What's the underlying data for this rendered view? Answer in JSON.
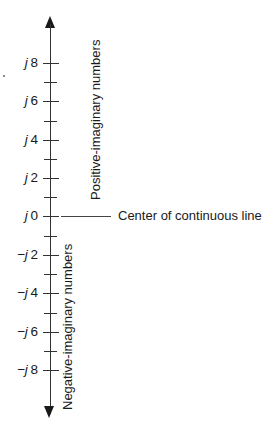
{
  "diagram": {
    "axis": {
      "orientation": "vertical",
      "arrows": [
        "up",
        "down"
      ],
      "center_y": 216,
      "major_spacing_px": 38.4
    },
    "ticks": [
      {
        "prefix": "j",
        "value": "8",
        "y": 63
      },
      {
        "prefix": "j",
        "value": "6",
        "y": 101
      },
      {
        "prefix": "j",
        "value": "4",
        "y": 140
      },
      {
        "prefix": "j",
        "value": "2",
        "y": 178
      },
      {
        "prefix": "j",
        "value": "0",
        "y": 216
      },
      {
        "prefix": "−j",
        "value": "2",
        "y": 255
      },
      {
        "prefix": "−j",
        "value": "4",
        "y": 293
      },
      {
        "prefix": "−j",
        "value": "6",
        "y": 332
      },
      {
        "prefix": "−j",
        "value": "8",
        "y": 370
      }
    ],
    "minor_ticks_y": [
      82,
      121,
      159,
      197,
      236,
      274,
      313,
      351
    ],
    "labels": {
      "positive": "Positive-imaginary numbers",
      "negative": "Negative-imaginary numbers",
      "center": "Center of continuous line"
    },
    "colors": {
      "line": "#333333",
      "text": "#1a1a1a",
      "background": "#ffffff"
    }
  }
}
